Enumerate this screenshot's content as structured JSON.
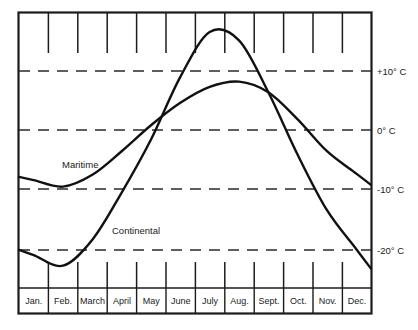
{
  "figure": {
    "name": "climate-temperature-chart",
    "background_color": "#ffffff",
    "line_color": "#111111",
    "grid_color": "#2a2a2a"
  },
  "chart_data": {
    "type": "line",
    "title": "",
    "subtitle": "",
    "xlabel": "",
    "ylabel": "",
    "grid": true,
    "grid_axis": "y",
    "grid_style": "dashed",
    "legend": "inline-annotations",
    "ylim": [
      -25,
      20
    ],
    "ytick_labels": [
      "+10° C",
      "0° C",
      "-10° C",
      "-20° C"
    ],
    "ytick_values": [
      10,
      0,
      -10,
      -20
    ],
    "categories": [
      "Jan.",
      "Feb.",
      "March",
      "April",
      "May",
      "June",
      "July",
      "Aug.",
      "Sept.",
      "Oct.",
      "Nov.",
      "Dec."
    ],
    "series": [
      {
        "name": "Maritime",
        "label": "Maritime",
        "values": [
          -8.5,
          -9.6,
          -7.6,
          -3.6,
          0.8,
          4.6,
          7.3,
          8.2,
          6.4,
          1.8,
          -3.6,
          -7.4
        ]
      },
      {
        "name": "Continental",
        "label": "Continental",
        "values": [
          -21.2,
          -23.0,
          -18.6,
          -10.6,
          -1.6,
          9.0,
          16.6,
          15.2,
          6.4,
          -4.2,
          -13.6,
          -20.2
        ]
      }
    ],
    "annotations": [
      {
        "text": "Maritime",
        "series": "Maritime",
        "x_month": "Feb.",
        "value_ref": -11.4
      },
      {
        "text": "Continental",
        "series": "Continental",
        "x_month": "April",
        "value_ref": -21.5
      }
    ]
  },
  "axis": {
    "y_labels": [
      {
        "id": "plus-ten",
        "text": "+10° C",
        "value": 10
      },
      {
        "id": "zero",
        "text": "0° C",
        "value": 0
      },
      {
        "id": "minus-ten",
        "text": "-10° C",
        "value": -10
      },
      {
        "id": "minus-twenty",
        "text": "-20° C",
        "value": -20
      }
    ],
    "x_labels": [
      {
        "id": "jan",
        "text": "Jan."
      },
      {
        "id": "feb",
        "text": "Feb."
      },
      {
        "id": "mar",
        "text": "March"
      },
      {
        "id": "apr",
        "text": "April"
      },
      {
        "id": "may",
        "text": "May"
      },
      {
        "id": "jun",
        "text": "June"
      },
      {
        "id": "jul",
        "text": "July"
      },
      {
        "id": "aug",
        "text": "Aug."
      },
      {
        "id": "sep",
        "text": "Sept."
      },
      {
        "id": "oct",
        "text": "Oct."
      },
      {
        "id": "nov",
        "text": "Nov."
      },
      {
        "id": "dec",
        "text": "Dec."
      }
    ]
  },
  "series_labels": {
    "maritime": "Maritime",
    "continental": "Continental"
  }
}
